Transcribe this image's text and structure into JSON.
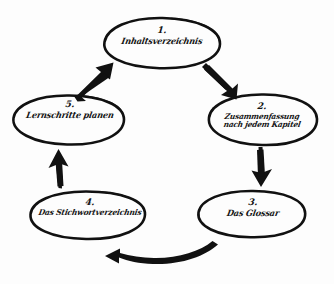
{
  "diagram": {
    "kind": "hand-drawn-cycle-diagram",
    "medium": "black ink on white paper",
    "background_color": "#fdfdfd",
    "ink_color": "#111111",
    "flow_direction": "clockwise",
    "node_count": 5,
    "arrow_count": 5,
    "nodes": [
      {
        "id": "node-1",
        "number": "1.",
        "text": "Inhaltsverzeichnis",
        "lines": [
          "Inhaltsverzeichnis"
        ],
        "position": "top"
      },
      {
        "id": "node-2",
        "number": "2.",
        "text": "Zusammenfassung nach jedem Kapitel",
        "lines": [
          "Zusammenfassung",
          "nach jedem Kapitel"
        ],
        "position": "right"
      },
      {
        "id": "node-3",
        "number": "3.",
        "text": "Das Glossar",
        "lines": [
          "Das Glossar"
        ],
        "position": "bottom-right"
      },
      {
        "id": "node-4",
        "number": "4.",
        "text": "Das Stichwortverzeichnis",
        "lines": [
          "Das Stichwortverzeichnis"
        ],
        "position": "bottom-left"
      },
      {
        "id": "node-5",
        "number": "5.",
        "text": "Lernschritte planen",
        "lines": [
          "Lernschritte planen"
        ],
        "position": "left"
      }
    ],
    "arrows": [
      {
        "id": "arrow-1-to-2",
        "from": "node-1",
        "to": "node-2",
        "shape": "diagonal-down-right"
      },
      {
        "id": "arrow-2-to-3",
        "from": "node-2",
        "to": "node-3",
        "shape": "vertical-down"
      },
      {
        "id": "arrow-3-to-4",
        "from": "node-3",
        "to": "node-4",
        "shape": "curved-left"
      },
      {
        "id": "arrow-4-to-5",
        "from": "node-4",
        "to": "node-5",
        "shape": "vertical-up"
      },
      {
        "id": "arrow-5-to-1",
        "from": "node-5",
        "to": "node-1",
        "shape": "diagonal-up-right"
      }
    ]
  }
}
